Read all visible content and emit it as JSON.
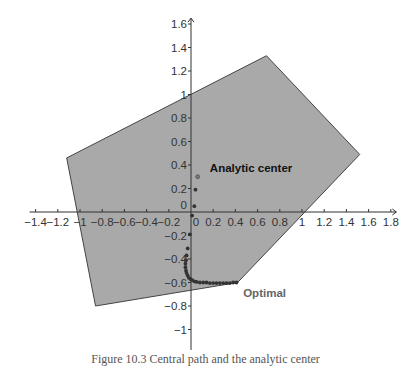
{
  "chart_data": {
    "type": "scatter",
    "title": "",
    "xlabel": "",
    "ylabel": "",
    "xlim": [
      -1.5,
      1.85
    ],
    "ylim": [
      -1.1,
      1.65
    ],
    "grid": false,
    "x_ticks": [
      -1.4,
      -1.2,
      -1,
      -0.8,
      -0.6,
      -0.4,
      -0.2,
      0,
      0.2,
      0.4,
      0.6,
      0.8,
      1,
      1.2,
      1.4,
      1.6,
      1.8
    ],
    "x_tick_labels": [
      "−1.4",
      "−1.2",
      "−1",
      "−0.8",
      "−0.6",
      "−0.4",
      "−0.2",
      "0",
      "0.2",
      "0.4",
      "0.6",
      "0.8",
      "1",
      "1.2",
      "1.4",
      "1.6",
      "1.8"
    ],
    "y_ticks": [
      -1,
      -0.8,
      -0.6,
      -0.4,
      -0.2,
      0,
      0.2,
      0.4,
      0.6,
      0.8,
      1,
      1.2,
      1.4,
      1.6
    ],
    "y_tick_labels": [
      "−1",
      "−0.8",
      "−0.6",
      "−0.4",
      "−0.2",
      "0",
      "0.2",
      "0.4",
      "0.6",
      "0.8",
      "1",
      "1.2",
      "1.4",
      "1.6"
    ],
    "feasible_region": {
      "fill": "#a9a9a9",
      "stroke": "#444444",
      "vertices": [
        [
          0.68,
          1.33
        ],
        [
          1.52,
          0.49
        ],
        [
          0.42,
          -0.6
        ],
        [
          -0.86,
          -0.8
        ],
        [
          -1.12,
          0.46
        ]
      ]
    },
    "series": [
      {
        "name": "central path",
        "color": "#333333",
        "points": [
          [
            0.06,
            0.3
          ],
          [
            0.04,
            0.19
          ],
          [
            0.03,
            0.05
          ],
          [
            0.01,
            -0.03
          ],
          [
            -0.01,
            -0.19
          ],
          [
            -0.03,
            -0.31
          ],
          [
            -0.04,
            -0.37
          ],
          [
            -0.045,
            -0.41
          ],
          [
            -0.05,
            -0.44
          ],
          [
            -0.05,
            -0.47
          ],
          [
            -0.045,
            -0.5
          ],
          [
            -0.04,
            -0.52
          ],
          [
            -0.03,
            -0.54
          ],
          [
            -0.02,
            -0.56
          ],
          [
            -0.005,
            -0.57
          ],
          [
            0.01,
            -0.58
          ],
          [
            0.03,
            -0.59
          ],
          [
            0.05,
            -0.595
          ],
          [
            0.08,
            -0.6
          ],
          [
            0.11,
            -0.6
          ],
          [
            0.14,
            -0.6
          ],
          [
            0.17,
            -0.605
          ],
          [
            0.2,
            -0.605
          ],
          [
            0.23,
            -0.605
          ],
          [
            0.26,
            -0.605
          ],
          [
            0.29,
            -0.605
          ],
          [
            0.32,
            -0.605
          ],
          [
            0.35,
            -0.605
          ],
          [
            0.38,
            -0.6
          ],
          [
            0.41,
            -0.6
          ]
        ]
      }
    ],
    "analytic_center": [
      0.06,
      0.3
    ],
    "optimal": [
      0.42,
      -0.6
    ],
    "annotations": [
      {
        "text": "Analytic center",
        "x": 0.17,
        "y": 0.34
      },
      {
        "text": "Optimal",
        "x": 0.47,
        "y": -0.72
      }
    ]
  },
  "caption": "Figure 10.3  Central path and the analytic center"
}
